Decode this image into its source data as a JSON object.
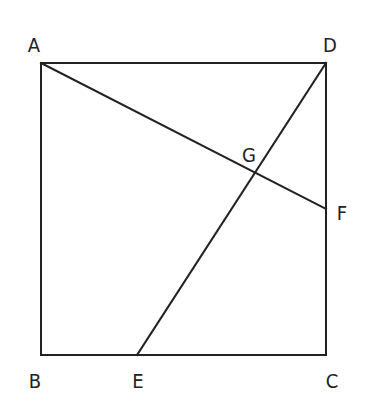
{
  "diagram": {
    "type": "geometry",
    "stroke_color": "#222222",
    "background": "#ffffff",
    "points": {
      "A": {
        "x": 41,
        "y": 63
      },
      "B": {
        "x": 41,
        "y": 355
      },
      "C": {
        "x": 326,
        "y": 355
      },
      "D": {
        "x": 326,
        "y": 63
      },
      "E": {
        "x": 137,
        "y": 355
      },
      "F": {
        "x": 326,
        "y": 209
      },
      "G": {
        "x": 255,
        "y": 174
      }
    },
    "segments": [
      [
        "A",
        "D"
      ],
      [
        "D",
        "C"
      ],
      [
        "C",
        "B"
      ],
      [
        "B",
        "A"
      ],
      [
        "A",
        "F"
      ],
      [
        "D",
        "E"
      ]
    ],
    "labels": [
      {
        "text": "A",
        "x": 34,
        "y": 45
      },
      {
        "text": "D",
        "x": 330,
        "y": 45
      },
      {
        "text": "G",
        "x": 249,
        "y": 155
      },
      {
        "text": "F",
        "x": 342,
        "y": 213
      },
      {
        "text": "B",
        "x": 35,
        "y": 381
      },
      {
        "text": "E",
        "x": 138,
        "y": 381
      },
      {
        "text": "C",
        "x": 332,
        "y": 381
      }
    ]
  }
}
